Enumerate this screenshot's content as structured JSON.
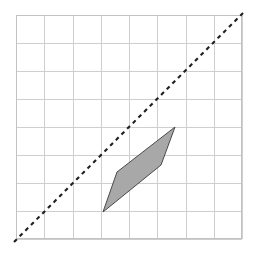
{
  "figure": {
    "canvas": {
      "width": 257,
      "height": 254,
      "background": "#ffffff"
    }
  },
  "chart_data": {
    "type": "scatter",
    "title": "",
    "subtitle": "",
    "xlabel": "",
    "ylabel": "",
    "grid": true,
    "legend": null,
    "legend_position": "none",
    "xlim": [
      0,
      8
    ],
    "ylim": [
      0,
      8
    ],
    "xticks": [
      0,
      1,
      2,
      3,
      4,
      5,
      6,
      7,
      8
    ],
    "yticks": [
      0,
      1,
      2,
      3,
      4,
      5,
      6,
      7,
      8
    ],
    "xtick_labels": [
      "",
      "",
      "",
      "",
      "",
      "",
      "",
      "",
      ""
    ],
    "ytick_labels": [
      "",
      "",
      "",
      "",
      "",
      "",
      "",
      "",
      ""
    ],
    "grid_columns": 8,
    "grid_rows": 8,
    "grid_cell_px": 28.25,
    "grid_color": "#cfcfcf",
    "grid_border_color": "#c2c2c2",
    "plot_box_px": {
      "left": 16,
      "top": 15,
      "right": 242,
      "bottom": 239
    },
    "series": [
      {
        "name": "dashed-diagonal",
        "type": "line",
        "style": "dashed",
        "dash_pattern": [
          4,
          4
        ],
        "color": "#1f1f1f",
        "width": 2.1,
        "x": [
          -0.07,
          8.03
        ],
        "y": [
          -0.11,
          8.05
        ],
        "points_px": [
          {
            "x": 14,
            "y": 242
          },
          {
            "x": 243,
            "y": 13
          }
        ],
        "slope": 1,
        "equation": "y = x"
      },
      {
        "name": "shaded-quadrilateral",
        "type": "polygon",
        "fill": "#a8a8a8",
        "stroke": "#4a4a4a",
        "stroke_width": 1,
        "vertices": [
          {
            "x": 3.08,
            "y": 0.96
          },
          {
            "x": 3.58,
            "y": 2.37
          },
          {
            "x": 5.63,
            "y": 3.97
          },
          {
            "x": 5.13,
            "y": 2.62
          }
        ],
        "vertices_px": [
          {
            "x": 103,
            "y": 212
          },
          {
            "x": 117,
            "y": 172
          },
          {
            "x": 175,
            "y": 127
          },
          {
            "x": 161,
            "y": 165
          }
        ],
        "vertex_labels": [
          "bottom",
          "left",
          "top",
          "right"
        ]
      }
    ],
    "annotations": []
  }
}
